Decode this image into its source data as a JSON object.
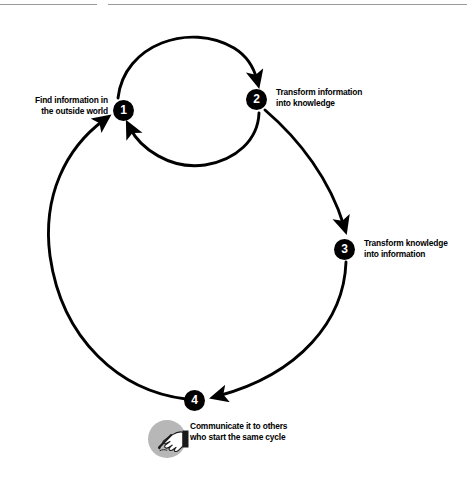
{
  "figure": {
    "type": "knowledge-cycle-diagram",
    "rules": {
      "count": 2
    },
    "colors": {
      "node_fill": "#000000",
      "node_text": "#ffffff",
      "arc": "#000000",
      "rule": "#9a9a9a",
      "disc": "#b7b7b7"
    },
    "nodes": [
      {
        "number": "1",
        "label": "Find information in\nthe outside world"
      },
      {
        "number": "2",
        "label": "Transform information\ninto knowledge"
      },
      {
        "number": "3",
        "label": "Transform knowledge\ninto information"
      },
      {
        "number": "4",
        "label": "Communicate it to others\nwho start the same cycle"
      }
    ],
    "icons": {
      "hand_writing": "hand-writing-icon"
    }
  }
}
